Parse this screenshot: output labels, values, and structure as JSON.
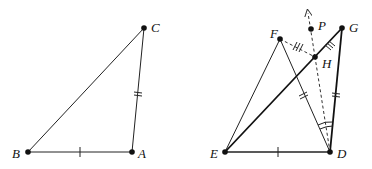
{
  "figure_left": {
    "points": [
      {
        "id": "A",
        "label": "A"
      },
      {
        "id": "B",
        "label": "B"
      },
      {
        "id": "C",
        "label": "C"
      }
    ],
    "segments": [
      "BA",
      "BC",
      "AC"
    ],
    "congruence_marks": {
      "BA": 1,
      "AC": 2
    }
  },
  "figure_right": {
    "points": [
      {
        "id": "D",
        "label": "D"
      },
      {
        "id": "E",
        "label": "E"
      },
      {
        "id": "F",
        "label": "F"
      },
      {
        "id": "G",
        "label": "G"
      },
      {
        "id": "H",
        "label": "H"
      },
      {
        "id": "P",
        "label": "P"
      }
    ],
    "segments": [
      "ED",
      "EF",
      "FD",
      "EG",
      "DG"
    ],
    "dashed_segments": [
      "FH",
      "DH",
      "HP-ray"
    ],
    "congruence_marks": {
      "ED": 1,
      "FD": 2,
      "DG": 2,
      "FH": 3,
      "HG": 3
    },
    "angle_marks": "angle FDH and angle HDG marked equal"
  }
}
